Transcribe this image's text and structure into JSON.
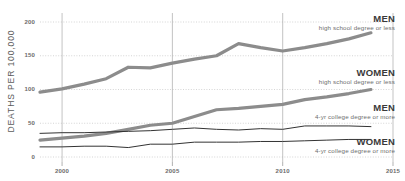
{
  "chart_data": {
    "type": "line",
    "title": "",
    "xlabel": "",
    "ylabel": "DEATHS PER 100,000",
    "xlim": [
      1999,
      2015
    ],
    "ylim": [
      0,
      200
    ],
    "grid": true,
    "legend_position": "right-inline-annotations",
    "y_ticks": [
      0,
      50,
      100,
      150,
      200
    ],
    "y_tick_labels": [
      "0",
      "50",
      "100",
      "150",
      "200"
    ],
    "x_ticks": [
      2000,
      2005,
      2010,
      2015
    ],
    "x_tick_labels": [
      "2000",
      "2005",
      "2010",
      "2015"
    ],
    "x": [
      1999,
      2000,
      2001,
      2002,
      2003,
      2004,
      2005,
      2006,
      2007,
      2008,
      2009,
      2010,
      2011,
      2012,
      2013,
      2014
    ],
    "series": [
      {
        "name": "MEN",
        "sub": "high school degree or less",
        "color": "#8c8c8c",
        "width": 3.2,
        "values": [
          96,
          101,
          108,
          116,
          133,
          132,
          139,
          145,
          150,
          168,
          162,
          157,
          162,
          168,
          175,
          184
        ]
      },
      {
        "name": "WOMEN",
        "sub": "high school degree or less",
        "color": "#8c8c8c",
        "width": 3.2,
        "values": [
          25,
          28,
          31,
          35,
          41,
          47,
          50,
          60,
          70,
          72,
          75,
          78,
          85,
          89,
          94,
          100
        ]
      },
      {
        "name": "MEN",
        "sub": "4-yr college degree or more",
        "color": "#333333",
        "width": 1.0,
        "values": [
          35,
          36,
          36,
          37,
          38,
          39,
          41,
          43,
          41,
          40,
          42,
          41,
          46,
          46,
          46,
          45
        ]
      },
      {
        "name": "WOMEN",
        "sub": "4-yr college degree or more",
        "color": "#333333",
        "width": 1.0,
        "values": [
          15,
          15,
          16,
          16,
          14,
          19,
          19,
          22,
          22,
          22,
          23,
          23,
          24,
          25,
          26,
          26
        ]
      }
    ],
    "annotations": [
      {
        "title": "MEN",
        "sub": "high school degree or less",
        "x": 395,
        "y": 14
      },
      {
        "title": "WOMEN",
        "sub": "high school degree or less",
        "x": 395,
        "y": 68
      },
      {
        "title": "MEN",
        "sub": "4-yr college degree or more",
        "x": 395,
        "y": 103
      },
      {
        "title": "WOMEN",
        "sub": "4-yr college degree or more",
        "x": 395,
        "y": 137
      }
    ]
  }
}
